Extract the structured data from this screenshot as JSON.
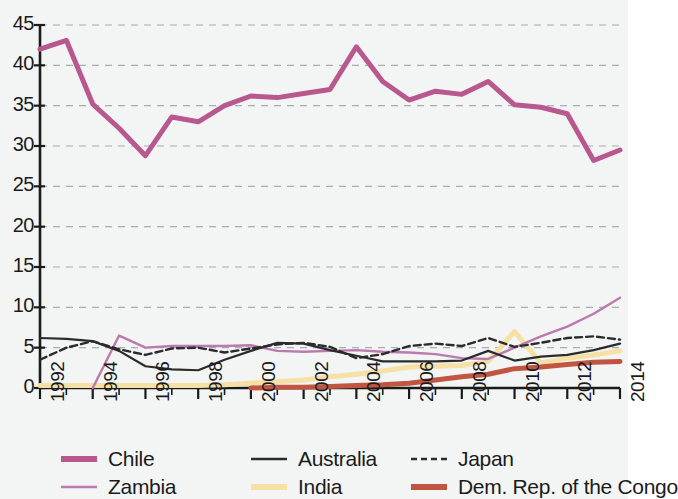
{
  "chart_data": {
    "type": "line",
    "title": "",
    "subtitle": "",
    "xlabel": "",
    "ylabel": "",
    "xlim": [
      1992,
      2014
    ],
    "ylim": [
      0,
      45
    ],
    "grid": true,
    "grid_axis": "y",
    "legend_position": "bottom",
    "x": [
      1992,
      1993,
      1994,
      1995,
      1996,
      1997,
      1998,
      1999,
      2000,
      2001,
      2002,
      2003,
      2004,
      2005,
      2006,
      2007,
      2008,
      2009,
      2010,
      2011,
      2012,
      2013,
      2014
    ],
    "yticks": [
      0,
      5,
      10,
      15,
      20,
      25,
      30,
      35,
      40,
      45
    ],
    "ytick_labels": [
      "0",
      "5",
      "10",
      "15",
      "20",
      "25",
      "30",
      "35",
      "40",
      "45"
    ],
    "xticks": [
      1992,
      1994,
      1996,
      1998,
      2000,
      2002,
      2004,
      2006,
      2008,
      2010,
      2012,
      2014
    ],
    "xtick_labels": [
      "1992",
      "1994",
      "1996",
      "1998",
      "2000",
      "2002",
      "2004",
      "2006",
      "2008",
      "2010",
      "2012",
      "2014"
    ],
    "xtick_minor": [
      1993,
      1995,
      1997,
      1999,
      2001,
      2003,
      2005,
      2007,
      2009,
      2011,
      2013
    ],
    "series": [
      {
        "name": "Chile",
        "color": "#b8588f",
        "width": 5.0,
        "dash": "none",
        "values": [
          42.0,
          43.1,
          35.2,
          32.2,
          28.8,
          33.6,
          33.0,
          35.0,
          36.2,
          36.0,
          36.5,
          37.0,
          42.3,
          38.0,
          35.7,
          36.8,
          36.4,
          38.0,
          35.1,
          34.8,
          34.0,
          28.2,
          29.5
        ]
      },
      {
        "name": "Australia",
        "color": "#2b2b2b",
        "width": 2.2,
        "dash": "none",
        "values": [
          6.2,
          6.1,
          5.8,
          4.6,
          2.7,
          2.3,
          2.2,
          3.5,
          4.6,
          5.6,
          5.5,
          4.7,
          4.0,
          3.3,
          3.3,
          3.3,
          3.4,
          4.6,
          3.4,
          3.9,
          4.1,
          4.7,
          5.5
        ]
      },
      {
        "name": "Japan",
        "color": "#2b2b2b",
        "width": 2.4,
        "dash": "7,4",
        "values": [
          3.5,
          5.0,
          5.8,
          4.8,
          4.1,
          4.9,
          5.0,
          4.4,
          4.9,
          5.4,
          5.6,
          5.1,
          3.7,
          4.2,
          5.2,
          5.5,
          5.2,
          6.2,
          5.1,
          5.6,
          6.2,
          6.4,
          6.0
        ]
      },
      {
        "name": "Zambia",
        "color": "#bb79ae",
        "width": 2.4,
        "dash": "none",
        "values": [
          0.0,
          0.0,
          0.0,
          6.5,
          5.0,
          5.2,
          5.2,
          5.2,
          5.3,
          4.6,
          4.5,
          4.6,
          4.7,
          4.5,
          4.4,
          4.2,
          3.7,
          3.6,
          5.0,
          6.4,
          7.6,
          9.2,
          11.2
        ]
      },
      {
        "name": "India",
        "color": "#f6e0a6",
        "width": 5.0,
        "dash": "none",
        "values": [
          0.3,
          0.3,
          0.3,
          0.3,
          0.3,
          0.3,
          0.3,
          0.4,
          0.6,
          0.8,
          1.0,
          1.4,
          1.7,
          2.1,
          2.6,
          2.7,
          2.8,
          3.3,
          7.0,
          3.1,
          3.7,
          4.1,
          4.6
        ]
      },
      {
        "name": "Dem. Rep. of the Congo",
        "color": "#c05642",
        "width": 5.0,
        "dash": "none",
        "values": [
          0.0,
          0.0,
          0.0,
          0.0,
          0.0,
          0.0,
          0.0,
          0.0,
          0.0,
          0.1,
          0.1,
          0.2,
          0.3,
          0.4,
          0.6,
          1.0,
          1.4,
          1.7,
          2.4,
          2.6,
          2.9,
          3.2,
          3.3
        ]
      }
    ]
  },
  "legend": {
    "items": [
      {
        "label": "Chile",
        "color": "#b8588f",
        "width": 6,
        "dash": "none"
      },
      {
        "label": "Australia",
        "color": "#2b2b2b",
        "width": 2.5,
        "dash": "none"
      },
      {
        "label": "Japan",
        "color": "#2b2b2b",
        "width": 2.5,
        "dash": "6,4"
      },
      {
        "label": "Zambia",
        "color": "#bb79ae",
        "width": 2.5,
        "dash": "none"
      },
      {
        "label": "India",
        "color": "#f6e0a6",
        "width": 6,
        "dash": "none"
      },
      {
        "label": "Dem. Rep. of the Congo",
        "color": "#c05642",
        "width": 6,
        "dash": "none"
      }
    ]
  },
  "style": {
    "background": "#f3f5f4",
    "axis_color": "#1b1b1b",
    "grid_color": "#9aa0a6"
  }
}
